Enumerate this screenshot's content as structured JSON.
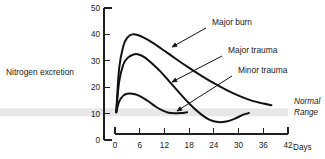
{
  "chart_data": {
    "type": "line",
    "title": "",
    "subtitle": "",
    "xlabel": "Days",
    "ylabel": "Nitrogen excretion",
    "xlim": [
      0,
      42
    ],
    "ylim": [
      0,
      50
    ],
    "xticks": [
      "0",
      "6",
      "12",
      "18",
      "24",
      "30",
      "36",
      "42"
    ],
    "xtick_values": [
      0,
      6,
      12,
      18,
      24,
      30,
      36,
      42
    ],
    "yticks": [
      "0",
      "10",
      "20",
      "30",
      "40",
      "50"
    ],
    "ytick_values": [
      0,
      10,
      20,
      30,
      40,
      50
    ],
    "grid": false,
    "legend_position": "inline-annotations",
    "bands": [
      {
        "name": "normal-range",
        "label_line1": "Normal",
        "label_line2": "Range",
        "y_low": 9.0,
        "y_high": 12.0,
        "color": "#e6e6e6"
      }
    ],
    "series": [
      {
        "name": "Major burn",
        "color": "#111111",
        "x": [
          0.3,
          1.0,
          2.0,
          3.0,
          4.2,
          5.5,
          7.0,
          9.0,
          12.0,
          15.0,
          18.0,
          21.0,
          24.0,
          27.0,
          30.0,
          33.0,
          36.0,
          38.0
        ],
        "y": [
          10.5,
          27.0,
          35.5,
          38.8,
          40.0,
          39.8,
          38.8,
          37.0,
          33.8,
          30.5,
          27.3,
          24.3,
          21.5,
          19.0,
          16.8,
          15.0,
          13.8,
          13.2
        ]
      },
      {
        "name": "Major trauma",
        "color": "#111111",
        "x": [
          0.3,
          1.0,
          2.0,
          3.0,
          4.5,
          5.5,
          7.0,
          9.0,
          11.0,
          13.0,
          15.0,
          17.0,
          19.0,
          21.0,
          23.0,
          25.0,
          27.0,
          29.0,
          31.0,
          32.5
        ],
        "y": [
          10.5,
          22.0,
          28.5,
          31.0,
          32.4,
          32.5,
          31.5,
          29.0,
          26.0,
          22.5,
          19.0,
          15.5,
          12.3,
          9.6,
          7.6,
          6.8,
          7.0,
          8.0,
          9.5,
          10.2
        ]
      },
      {
        "name": "Minor trauma",
        "color": "#111111",
        "x": [
          0.3,
          1.0,
          2.0,
          3.0,
          4.2,
          5.5,
          7.0,
          8.5,
          10.0,
          11.5,
          13.0,
          14.5,
          16.0,
          17.5
        ],
        "y": [
          10.5,
          14.5,
          16.8,
          17.5,
          17.5,
          17.0,
          15.8,
          14.2,
          12.5,
          11.2,
          10.3,
          10.1,
          10.2,
          10.5
        ]
      }
    ],
    "annotations": [
      {
        "name": "Major burn",
        "text": "Major burn",
        "text_x": 212,
        "text_y": 25,
        "arrow_from_x": 206,
        "arrow_from_y": 28,
        "arrow_to_x": 172,
        "arrow_to_y": 47
      },
      {
        "name": "Major trauma",
        "text": "Major trauma",
        "text_x": 228,
        "text_y": 53,
        "arrow_from_x": 222,
        "arrow_from_y": 56,
        "arrow_to_x": 172,
        "arrow_to_y": 82
      },
      {
        "name": "Minor trauma",
        "text": "Minor trauma",
        "text_x": 238,
        "text_y": 73,
        "arrow_from_x": 232,
        "arrow_from_y": 76,
        "arrow_to_x": 177,
        "arrow_to_y": 111
      }
    ]
  }
}
